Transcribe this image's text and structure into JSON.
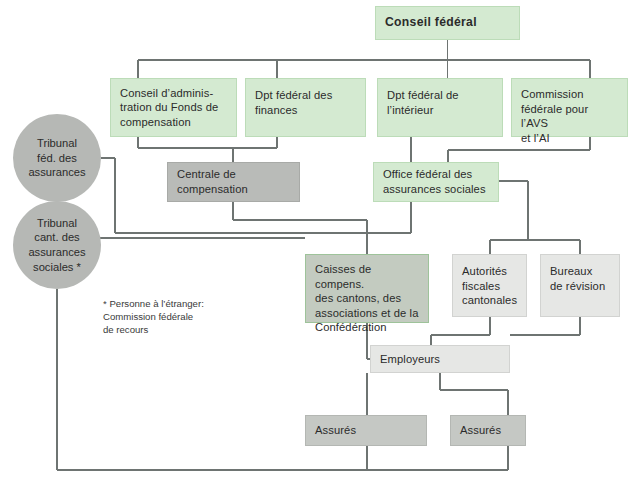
{
  "diagram": {
    "title": "Conseil fédéral",
    "line_color": "#6e7472",
    "colors": {
      "green": "#d4ead1",
      "green_border": "#bcdcb8",
      "grey_dark": "#b9bbb8",
      "grey_light": "#e6e7e5",
      "grey_medium": "#c5c8c4",
      "green_grey": "#c3cbc0",
      "circle_grey": "#b6b8b5",
      "text": "#2b2b2b"
    },
    "nodes": [
      {
        "id": "conseil-federal",
        "label": "Conseil  fédéral",
        "style": "green-bold",
        "x": 375,
        "y": 6,
        "w": 145,
        "h": 34
      },
      {
        "id": "conseil-administration",
        "label": "Conseil d’adminis-\ntration du Fonds de\ncompensation",
        "style": "green",
        "x": 110,
        "y": 78,
        "w": 127,
        "h": 59
      },
      {
        "id": "dpt-finances",
        "label": "Dpt fédéral des\nfinances",
        "style": "green",
        "x": 245,
        "y": 78,
        "w": 121,
        "h": 59
      },
      {
        "id": "dpt-interieur",
        "label": "Dpt fédéral de\nl’intérieur",
        "style": "green",
        "x": 377,
        "y": 78,
        "w": 126,
        "h": 59
      },
      {
        "id": "commission-avs-ai",
        "label": "Commission\nfédérale pour l’AVS\net l’AI",
        "style": "green",
        "x": 511,
        "y": 78,
        "w": 117,
        "h": 59
      },
      {
        "id": "centrale-compensation",
        "label": "Centrale de\ncompensation",
        "style": "grey",
        "x": 167,
        "y": 162,
        "w": 133,
        "h": 40
      },
      {
        "id": "office-federal",
        "label": "Office fédéral des\nassurances sociales",
        "style": "green",
        "x": 373,
        "y": 162,
        "w": 126,
        "h": 40
      },
      {
        "id": "caisses-compensation",
        "label": "Caisses de compens.\ndes cantons, des\nassociations et de la\nConfédération",
        "style": "greengrey",
        "x": 305,
        "y": 254,
        "w": 124,
        "h": 69
      },
      {
        "id": "autorites-fiscales",
        "label": "Autorités\nfiscales\ncantonales",
        "style": "grey-lt",
        "x": 452,
        "y": 254,
        "w": 75,
        "h": 63
      },
      {
        "id": "bureaux-revision",
        "label": "Bureaux\nde révision",
        "style": "grey-lt",
        "x": 540,
        "y": 254,
        "w": 80,
        "h": 63
      },
      {
        "id": "employeurs",
        "label": "Employeurs",
        "style": "grey-lt",
        "x": 370,
        "y": 345,
        "w": 140,
        "h": 28
      },
      {
        "id": "assures-left",
        "label": "Assurés",
        "style": "grey-md",
        "x": 305,
        "y": 415,
        "w": 122,
        "h": 31
      },
      {
        "id": "assures-right",
        "label": "Assurés",
        "style": "grey-md",
        "x": 450,
        "y": 415,
        "w": 76,
        "h": 31
      }
    ],
    "circles": [
      {
        "id": "tribunal-federal",
        "label": "Tribunal\nféd. des\nassurances",
        "cx": 57,
        "cy": 158,
        "r": 44
      },
      {
        "id": "tribunal-cantonal",
        "label": "Tribunal\ncant. des\nassurances\nsociales *",
        "cx": 57,
        "cy": 245,
        "r": 44
      }
    ],
    "footnote": "* Personne à l’étranger:\n   Commission fédérale\n   de recours",
    "footnote_x": 103,
    "footnote_y": 297
  }
}
